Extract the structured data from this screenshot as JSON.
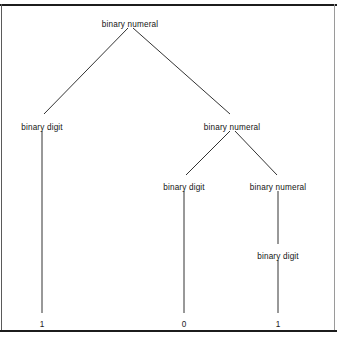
{
  "figure": {
    "kind": "parse-tree",
    "caption": "",
    "background_color": "#ffffff",
    "line_color": "#1c1c1c",
    "text_color": "#141414",
    "border": {
      "top_rule": true,
      "bottom_rule": true,
      "left_rule": true,
      "right_rule": true
    }
  },
  "tree": {
    "nodes": [
      {
        "id": "n0",
        "label": "binary numeral",
        "x": 130,
        "y": 20,
        "level": 0,
        "type": "nonterminal"
      },
      {
        "id": "n1",
        "label": "binary digit",
        "x": 42,
        "y": 123,
        "level": 1,
        "type": "nonterminal"
      },
      {
        "id": "n2",
        "label": "binary numeral",
        "x": 232,
        "y": 123,
        "level": 1,
        "type": "nonterminal"
      },
      {
        "id": "n3",
        "label": "binary digit",
        "x": 184,
        "y": 183,
        "level": 2,
        "type": "nonterminal"
      },
      {
        "id": "n4",
        "label": "binary numeral",
        "x": 278,
        "y": 183,
        "level": 2,
        "type": "nonterminal"
      },
      {
        "id": "n5",
        "label": "binary digit",
        "x": 278,
        "y": 252,
        "level": 3,
        "type": "nonterminal"
      }
    ],
    "leaves": [
      {
        "id": "t1",
        "label": "1",
        "x": 42,
        "y": 320,
        "parent": "n1"
      },
      {
        "id": "t2",
        "label": "0",
        "x": 184,
        "y": 320,
        "parent": "n3"
      },
      {
        "id": "t3",
        "label": "1",
        "x": 278,
        "y": 320,
        "parent": "n5"
      }
    ],
    "edges": [
      {
        "from": "n0",
        "to": "n1",
        "x1": 128,
        "y1": 28,
        "x2": 44,
        "y2": 114,
        "style": "diagonal"
      },
      {
        "from": "n0",
        "to": "n2",
        "x1": 133,
        "y1": 28,
        "x2": 230,
        "y2": 114,
        "style": "diagonal"
      },
      {
        "from": "n2",
        "to": "n3",
        "x1": 230,
        "y1": 131,
        "x2": 186,
        "y2": 175,
        "style": "diagonal"
      },
      {
        "from": "n2",
        "to": "n4",
        "x1": 235,
        "y1": 131,
        "x2": 277,
        "y2": 175,
        "style": "diagonal"
      },
      {
        "from": "n1",
        "to": "t1",
        "x1": 42,
        "y1": 131,
        "x2": 42,
        "y2": 313,
        "style": "vertical"
      },
      {
        "from": "n3",
        "to": "t2",
        "x1": 184,
        "y1": 191,
        "x2": 184,
        "y2": 313,
        "style": "vertical"
      },
      {
        "from": "n4",
        "to": "n5",
        "x1": 278,
        "y1": 191,
        "x2": 278,
        "y2": 244,
        "style": "vertical"
      },
      {
        "from": "n5",
        "to": "t3",
        "x1": 278,
        "y1": 260,
        "x2": 278,
        "y2": 313,
        "style": "vertical"
      }
    ],
    "derived_string": "101"
  }
}
